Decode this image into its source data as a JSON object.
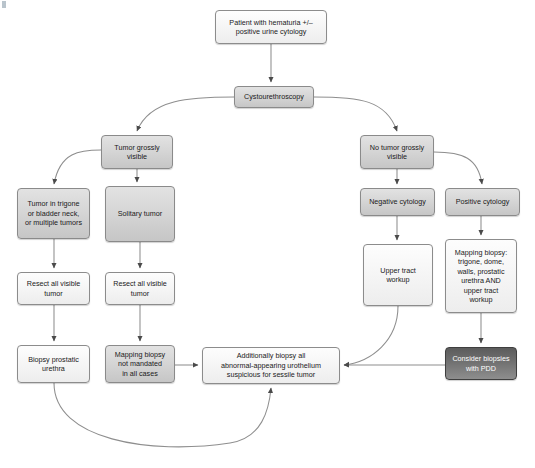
{
  "diagram": {
    "background": "#ffffff",
    "colors": {
      "light_fill": "#f6f6f6",
      "mid_fill": "#d6d6d6",
      "dark_fill": "#6e6e6e",
      "border": "#8c8c8c",
      "text": "#1a1a1a",
      "dark_text": "#ffffff",
      "edge": "#8a8a8a"
    },
    "nodes": [
      {
        "id": "start",
        "label": "Patient with hematuria +/–\npositive urine cytology",
        "style": "light",
        "x": 215,
        "y": 10,
        "w": 112,
        "h": 34
      },
      {
        "id": "cysto",
        "label": "Cystourethroscopy",
        "style": "mid",
        "x": 234,
        "y": 86,
        "w": 80,
        "h": 22
      },
      {
        "id": "tumor_vis",
        "label": "Tumor grossly\nvisible",
        "style": "mid",
        "x": 101,
        "y": 135,
        "w": 72,
        "h": 34
      },
      {
        "id": "no_tumor_vis",
        "label": "No tumor grossly\nvisible",
        "style": "mid",
        "x": 360,
        "y": 135,
        "w": 74,
        "h": 34
      },
      {
        "id": "trigone",
        "label": "Tumor in trigone\nor bladder neck,\nor multiple tumors",
        "style": "mid",
        "x": 17,
        "y": 188,
        "w": 73,
        "h": 51
      },
      {
        "id": "solitary",
        "label": "Solitary tumor",
        "style": "mid",
        "x": 105,
        "y": 186,
        "w": 70,
        "h": 56
      },
      {
        "id": "neg_cyt",
        "label": "Negative cytology",
        "style": "mid",
        "x": 360,
        "y": 188,
        "w": 75,
        "h": 28
      },
      {
        "id": "pos_cyt",
        "label": "Positive cytology",
        "style": "mid",
        "x": 445,
        "y": 188,
        "w": 75,
        "h": 28
      },
      {
        "id": "resect_left",
        "label": "Resect all visible\ntumor",
        "style": "light",
        "x": 17,
        "y": 272,
        "w": 73,
        "h": 33
      },
      {
        "id": "resect_right",
        "label": "Resect all visible\ntumor",
        "style": "light",
        "x": 105,
        "y": 272,
        "w": 70,
        "h": 33
      },
      {
        "id": "upper_tract",
        "label": "Upper tract\nworkup",
        "style": "light",
        "x": 363,
        "y": 244,
        "w": 70,
        "h": 62
      },
      {
        "id": "mapping_pos",
        "label": "Mapping biopsy:\ntrigone, dome,\nwalls, prostatic\nurethra AND\nupper tract\nworkup",
        "style": "light",
        "x": 445,
        "y": 239,
        "w": 72,
        "h": 74
      },
      {
        "id": "biopsy_pros",
        "label": "Biopsy prostatic\nurethra",
        "style": "light",
        "x": 17,
        "y": 345,
        "w": 73,
        "h": 38
      },
      {
        "id": "mapping_not",
        "label": "Mapping biopsy\nnot mandated\nin all cases",
        "style": "mid",
        "x": 105,
        "y": 345,
        "w": 70,
        "h": 38
      },
      {
        "id": "additionally",
        "label": "Additionally biopsy all\nabnormal-appearing urothelium\nsuspicious for sessile tumor",
        "style": "light",
        "x": 202,
        "y": 347,
        "w": 138,
        "h": 37
      },
      {
        "id": "pdd",
        "label": "Consider biopsies\nwith PDD",
        "style": "dark",
        "x": 445,
        "y": 347,
        "w": 72,
        "h": 33
      }
    ],
    "edges": [
      {
        "from": "start",
        "to": "cysto",
        "kind": "straight"
      },
      {
        "from": "cysto",
        "to": "tumor_vis",
        "kind": "curve-left"
      },
      {
        "from": "cysto",
        "to": "no_tumor_vis",
        "kind": "curve-right"
      },
      {
        "from": "tumor_vis",
        "to": "trigone",
        "kind": "curve-left"
      },
      {
        "from": "tumor_vis",
        "to": "solitary",
        "kind": "straight"
      },
      {
        "from": "no_tumor_vis",
        "to": "neg_cyt",
        "kind": "straight"
      },
      {
        "from": "no_tumor_vis",
        "to": "pos_cyt",
        "kind": "curve-right"
      },
      {
        "from": "trigone",
        "to": "resect_left",
        "kind": "straight"
      },
      {
        "from": "solitary",
        "to": "resect_right",
        "kind": "straight"
      },
      {
        "from": "neg_cyt",
        "to": "upper_tract",
        "kind": "straight"
      },
      {
        "from": "pos_cyt",
        "to": "mapping_pos",
        "kind": "straight"
      },
      {
        "from": "resect_left",
        "to": "biopsy_pros",
        "kind": "straight"
      },
      {
        "from": "resect_right",
        "to": "mapping_not",
        "kind": "straight"
      },
      {
        "from": "mapping_not",
        "to": "additionally",
        "kind": "straight-right"
      },
      {
        "from": "upper_tract",
        "to": "additionally",
        "kind": "curve-down-left"
      },
      {
        "from": "mapping_pos",
        "to": "pdd",
        "kind": "straight"
      },
      {
        "from": "pdd",
        "to": "additionally",
        "kind": "straight-left"
      },
      {
        "from": "biopsy_pros",
        "to": "additionally",
        "kind": "long-curve-bottom"
      }
    ]
  }
}
